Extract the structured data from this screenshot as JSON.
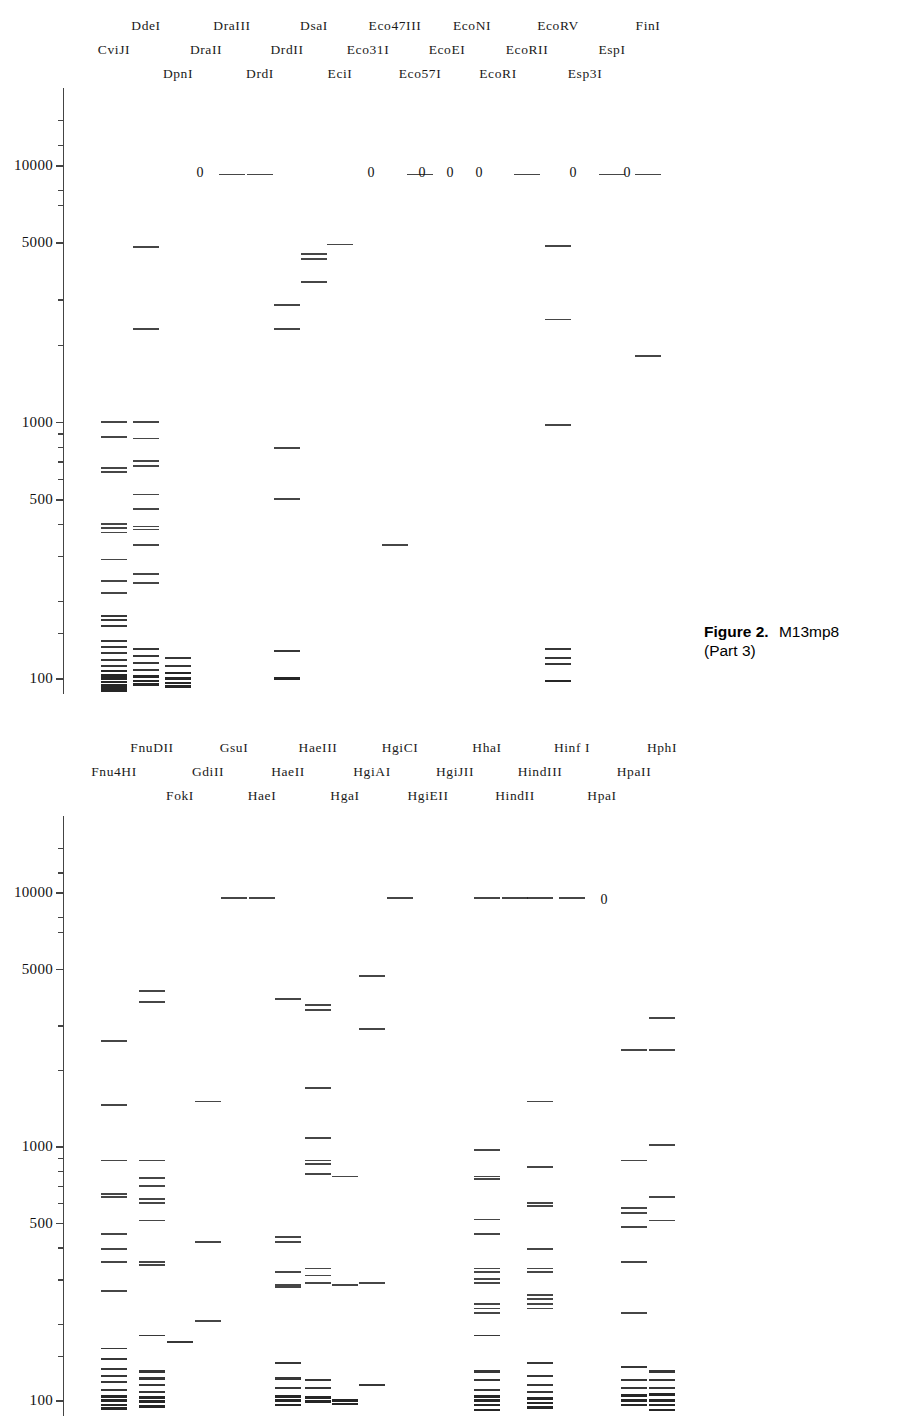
{
  "figure": {
    "caption_bold": "Figure 2.",
    "caption_title": "M13mp8",
    "part3_sub": "(Part 3)",
    "part4_sub": "(Part 4)",
    "accent": "#262626",
    "axis_color": "#444444"
  },
  "axis": {
    "scale": "log",
    "ylabel_ticks": [
      "10000",
      "5000",
      "1000",
      "500",
      "100"
    ],
    "ylim": [
      90,
      20000
    ],
    "minor_ticks": [
      15000,
      12000,
      8000,
      7000,
      3000,
      2000,
      900,
      800,
      700,
      600,
      400,
      300,
      200,
      150
    ]
  },
  "panel3": {
    "zero_marker": "0",
    "lanes": [
      {
        "name": "CviJI",
        "row": 2,
        "x": 114,
        "cuts": "many",
        "bands": [
          1000,
          870,
          660,
          635,
          400,
          385,
          370,
          290,
          240,
          215,
          175,
          168,
          160,
          140,
          132,
          125,
          118,
          112,
          107,
          103,
          100,
          97,
          94,
          92,
          90
        ]
      },
      {
        "name": "DdeI",
        "row": 1,
        "x": 146,
        "bands": [
          4800,
          2300,
          1000,
          860,
          700,
          670,
          520,
          455,
          330,
          390,
          380,
          255,
          235,
          130,
          122,
          115,
          108,
          102,
          98,
          95
        ]
      },
      {
        "name": "DpnI",
        "row": 3,
        "x": 178,
        "bands": [
          120,
          112,
          105,
          100,
          96,
          93
        ]
      },
      {
        "name": "DraII",
        "row": 2,
        "x": 206,
        "cuts": 0,
        "bands": []
      },
      {
        "name": "DraIII",
        "row": 1,
        "x": 232,
        "cuts": 0,
        "zero_line": true,
        "bands": [
          9200
        ]
      },
      {
        "name": "DrdI",
        "row": 3,
        "x": 260,
        "zero_line": true,
        "bands": [
          9200
        ]
      },
      {
        "name": "DrdII",
        "row": 2,
        "x": 287,
        "bands": [
          2850,
          2300,
          790,
          500,
          128,
          100
        ]
      },
      {
        "name": "DsaI",
        "row": 1,
        "x": 314,
        "bands": [
          4500,
          4300,
          3500
        ]
      },
      {
        "name": "EciI",
        "row": 3,
        "x": 340,
        "bands": [
          4900
        ]
      },
      {
        "name": "Eco31I",
        "row": 2,
        "x": 368,
        "cuts": 0,
        "bands": []
      },
      {
        "name": "Eco47III",
        "row": 1,
        "x": 395,
        "cuts": 0,
        "bands": [
          330
        ]
      },
      {
        "name": "Eco57I",
        "row": 3,
        "x": 420,
        "zero_line": true,
        "bands": [
          9200
        ]
      },
      {
        "name": "EcoEI",
        "row": 2,
        "x": 447,
        "cuts": 0,
        "bands": []
      },
      {
        "name": "EcoNI",
        "row": 1,
        "x": 472,
        "cuts": 0,
        "bands": []
      },
      {
        "name": "EcoRI",
        "row": 3,
        "x": 498,
        "cuts": 0,
        "bands": []
      },
      {
        "name": "EcoRII",
        "row": 2,
        "x": 527,
        "zero_line": true,
        "bands": [
          9200
        ]
      },
      {
        "name": "EcoRV",
        "row": 1,
        "x": 558,
        "bands": [
          4850,
          2500,
          970,
          130,
          120,
          114,
          98
        ]
      },
      {
        "name": "Esp3I",
        "row": 3,
        "x": 585,
        "cuts": 0,
        "bands": []
      },
      {
        "name": "EspI",
        "row": 2,
        "x": 612,
        "zero_line": true,
        "bands": [
          9200
        ]
      },
      {
        "name": "FinI",
        "row": 1,
        "x": 648,
        "zero_line": true,
        "bands": [
          9200,
          1800
        ]
      }
    ],
    "zero_positions": [
      200,
      371,
      422,
      450,
      479,
      573,
      627
    ]
  },
  "panel4": {
    "zero_marker": "0",
    "lanes": [
      {
        "name": "Fnu4HI",
        "row": 2,
        "x": 114,
        "bands": [
          2600,
          1450,
          880,
          650,
          630,
          450,
          395,
          350,
          270,
          160,
          145,
          133,
          125,
          118,
          110,
          104,
          100,
          96,
          93
        ]
      },
      {
        "name": "FnuDII",
        "row": 1,
        "x": 152,
        "bands": [
          4100,
          3700,
          880,
          750,
          700,
          620,
          600,
          510,
          350,
          340,
          180,
          130,
          122,
          115,
          108,
          103,
          99,
          95
        ]
      },
      {
        "name": "FokI",
        "row": 3,
        "x": 180,
        "bands": [
          170
        ]
      },
      {
        "name": "GdiII",
        "row": 2,
        "x": 208,
        "bands": [
          1500,
          420,
          205
        ]
      },
      {
        "name": "GsuI",
        "row": 1,
        "x": 234,
        "zero_line": true,
        "bands": [
          9500
        ]
      },
      {
        "name": "HaeI",
        "row": 3,
        "x": 262,
        "zero_line": true,
        "bands": [
          9500
        ]
      },
      {
        "name": "HaeII",
        "row": 2,
        "x": 288,
        "bands": [
          3800,
          440,
          420,
          320,
          285,
          280,
          140,
          122,
          112,
          104,
          100,
          96
        ]
      },
      {
        "name": "HaeIII",
        "row": 1,
        "x": 318,
        "bands": [
          3600,
          3450,
          1700,
          1080,
          880,
          850,
          780,
          330,
          310,
          290,
          120,
          112,
          103,
          99
        ]
      },
      {
        "name": "HgaI",
        "row": 3,
        "x": 345,
        "bands": [
          760,
          285,
          100,
          97
        ]
      },
      {
        "name": "HgiAI",
        "row": 2,
        "x": 372,
        "bands": [
          4700,
          2900,
          290,
          115
        ]
      },
      {
        "name": "HgiCI",
        "row": 1,
        "x": 400,
        "zero_line": true,
        "bands": [
          9500
        ]
      },
      {
        "name": "HgiEII",
        "row": 3,
        "x": 428,
        "cuts": 0,
        "bands": []
      },
      {
        "name": "HgiJII",
        "row": 2,
        "x": 455,
        "cuts": 0,
        "bands": []
      },
      {
        "name": "HhaI",
        "row": 1,
        "x": 487,
        "zero_line": true,
        "bands": [
          9500,
          970,
          760,
          745,
          515,
          450,
          330,
          320,
          300,
          290,
          240,
          230,
          220,
          180,
          130,
          120,
          110,
          104,
          100,
          96,
          92
        ]
      },
      {
        "name": "HindII",
        "row": 3,
        "x": 515,
        "zero_line": true,
        "bands": [
          9500
        ]
      },
      {
        "name": "HindIII",
        "row": 2,
        "x": 540,
        "zero_line": true,
        "bands": [
          9500,
          1500,
          830,
          600,
          580,
          395,
          330,
          320,
          260,
          250,
          240,
          230,
          140,
          125,
          115,
          108,
          102,
          98,
          94
        ]
      },
      {
        "name": "Hinf I",
        "row": 1,
        "x": 572,
        "zero_line": true,
        "bands": [
          9500
        ]
      },
      {
        "name": "HpaI",
        "row": 3,
        "x": 602,
        "cuts": 0,
        "zero": true,
        "bands": []
      },
      {
        "name": "HpaII",
        "row": 2,
        "x": 634,
        "bands": [
          2400,
          880,
          570,
          545,
          480,
          350,
          220,
          135,
          120,
          112,
          105,
          100,
          96
        ]
      },
      {
        "name": "HphI",
        "row": 1,
        "x": 662,
        "bands": [
          3200,
          2400,
          1010,
          630,
          510,
          130,
          120,
          112,
          106,
          100,
          96,
          92
        ]
      }
    ],
    "zero_positions": [
      604
    ]
  }
}
